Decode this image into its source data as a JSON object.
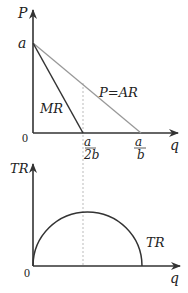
{
  "diagram": {
    "top_graph": {
      "y_axis_label": "P",
      "x_axis_label": "q",
      "origin_label": "0",
      "y_intercept_label": "a",
      "curves": [
        {
          "name": "MR",
          "label": "MR",
          "color": "#333333",
          "from": "a",
          "to": "a/2b"
        },
        {
          "name": "AR",
          "label": "P=AR",
          "color": "#999999",
          "from": "a",
          "to": "a/b"
        }
      ],
      "x_ticks": [
        {
          "num": "a",
          "den": "2b"
        },
        {
          "num": "a",
          "den": "b"
        }
      ]
    },
    "bottom_graph": {
      "y_axis_label": "TR",
      "x_axis_label": "q",
      "origin_label": "0",
      "curve": {
        "name": "TR",
        "label": "TR",
        "color": "#333333",
        "shape": "semi-ellipse",
        "peak_at": "a/2b"
      }
    },
    "guide_line": {
      "style": "dashed",
      "color": "#aaaaaa",
      "at": "a/2b"
    }
  }
}
